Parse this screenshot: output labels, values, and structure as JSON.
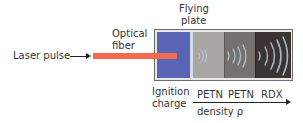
{
  "diagram": {
    "labels": {
      "laser_pulse": "Laser pulse",
      "optical_fiber_line1": "Optical",
      "optical_fiber_line2": "fiber",
      "flying_plate_line1": "Flying",
      "flying_plate_line2": "plate",
      "ignition_line1": "Ignition",
      "ignition_line2": "charge",
      "petn1": "PETN",
      "petn2": "PETN",
      "rdx": "RDX",
      "density": "density ρ"
    },
    "segments": [
      {
        "name": "ignition-charge",
        "color": "#5a64b4"
      },
      {
        "name": "flying-plate",
        "color": "#d6dde8"
      },
      {
        "name": "petn-low-density",
        "color": "#a9a7a5"
      },
      {
        "name": "petn-high-density",
        "color": "#76716e"
      },
      {
        "name": "rdx",
        "color": "#3c3333"
      }
    ],
    "colors": {
      "laser_fiber": "#f26a4f",
      "wave": "#b9d3e0"
    }
  }
}
